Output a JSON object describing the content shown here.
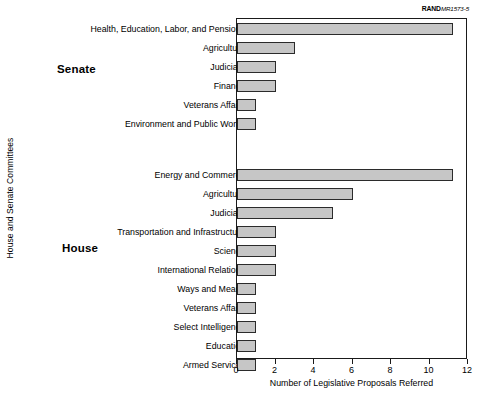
{
  "figure": {
    "source_prefix": "RAND",
    "source_id": "MR1573-5"
  },
  "chart_data": {
    "type": "bar",
    "orientation": "horizontal",
    "title": "",
    "xlabel": "Number of Legislative Proposals Referred",
    "ylabel": "House and Senate Committees",
    "xlim": [
      0,
      12
    ],
    "xticks": [
      0,
      2,
      4,
      6,
      8,
      10,
      12
    ],
    "xtick_labels": [
      "0",
      "2",
      "4",
      "6",
      "8",
      "10",
      "12"
    ],
    "grid": false,
    "legend": false,
    "bar_color": "#c6c6c6",
    "bar_edge_color": "#2b2b2b",
    "groups": [
      {
        "name": "Senate",
        "categories": [
          "Health, Education, Labor, and Pensions",
          "Agriculture",
          "Judiciary",
          "Finance",
          "Veterans Affairs",
          "Environment and Public Works"
        ],
        "values": [
          11.2,
          3,
          2,
          2,
          1,
          1
        ]
      },
      {
        "name": "House",
        "categories": [
          "Energy and Commerce",
          "Agriculture",
          "Judiciary",
          "Transportation and Infrastructure",
          "Science",
          "International Relations",
          "Ways and Means",
          "Veterans Affairs",
          "Select Intelligence",
          "Education",
          "Armed Services"
        ],
        "values": [
          11.2,
          6,
          5,
          2,
          2,
          2,
          1,
          1,
          1,
          1,
          1
        ]
      }
    ]
  }
}
